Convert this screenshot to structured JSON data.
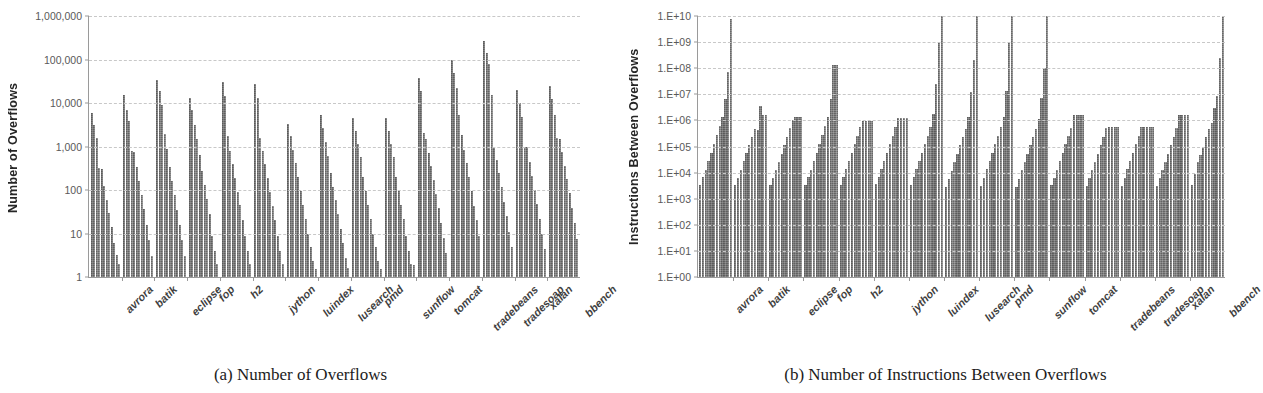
{
  "figure": {
    "panels": [
      {
        "id": "panel-a",
        "caption": "(a) Number of Overflows",
        "chart_key": 0
      },
      {
        "id": "panel-b",
        "caption": "(b) Number of Instructions Between Overflows",
        "chart_key": 1
      }
    ]
  },
  "chart_data": [
    {
      "type": "bar",
      "title": "",
      "subtitle": "",
      "caption": "(a) Number of Overflows",
      "xlabel": "",
      "ylabel": "Number of Overflows",
      "yscale": "log",
      "ylim": [
        1,
        1000000
      ],
      "yticks": [
        1,
        10,
        100,
        1000,
        10000,
        100000,
        1000000
      ],
      "ytick_labels": [
        "1",
        "10",
        "100",
        "1,000",
        "10,000",
        "100,000",
        "1,000,000"
      ],
      "grid": true,
      "legend": "none",
      "bar_color": "#707070",
      "categories": [
        "avrora",
        "batik",
        "eclipse",
        "fop",
        "h2",
        "jython",
        "luindex",
        "lusearch",
        "pmd",
        "sunflow",
        "tomcat",
        "tradebeans",
        "tradesoap",
        "xalan",
        "bbench"
      ],
      "series": [
        {
          "name": "bar1",
          "values": [
            6000,
            15000,
            34000,
            13000,
            30000,
            27000,
            3300,
            5400,
            4600,
            4600,
            38000,
            96000,
            270000,
            20000,
            25000
          ]
        },
        {
          "name": "bar2",
          "values": [
            3200,
            6800,
            19000,
            7000,
            14500,
            13000,
            1700,
            2700,
            2300,
            2300,
            18500,
            48000,
            140000,
            10000,
            12500
          ]
        },
        {
          "name": "bar3",
          "values": [
            1600,
            3800,
            8800,
            3100,
            1750,
            1600,
            850,
            1300,
            1150,
            1150,
            2000,
            22000,
            80000,
            4800,
            5200
          ]
        },
        {
          "name": "bar4",
          "values": [
            320,
            800,
            1900,
            1500,
            800,
            800,
            420,
            620,
            560,
            560,
            1500,
            5400,
            15000,
            1000,
            1600
          ]
        },
        {
          "name": "bar5",
          "values": [
            310,
            760,
            900,
            650,
            390,
            400,
            200,
            250,
            200,
            200,
            720,
            1800,
            1000,
            950,
            1500
          ]
        },
        {
          "name": "bar6",
          "values": [
            125,
            330,
            330,
            270,
            190,
            190,
            95,
            120,
            95,
            95,
            350,
            850,
            500,
            430,
            750
          ]
        },
        {
          "name": "bar7",
          "values": [
            60,
            160,
            160,
            130,
            92,
            90,
            46,
            58,
            46,
            46,
            170,
            410,
            240,
            205,
            360
          ]
        },
        {
          "name": "bar8",
          "values": [
            30,
            78,
            75,
            62,
            45,
            44,
            22,
            28,
            22,
            22,
            82,
            200,
            115,
            100,
            175
          ]
        },
        {
          "name": "bar9",
          "values": [
            14,
            36,
            34,
            28,
            20,
            20,
            10,
            13,
            10,
            9,
            38,
            95,
            54,
            48,
            84
          ]
        },
        {
          "name": "bar10",
          "values": [
            6,
            16,
            16,
            9,
            9,
            9,
            5,
            6,
            5,
            4,
            17,
            44,
            25,
            22,
            38
          ]
        },
        {
          "name": "bar11",
          "values": [
            3.2,
            7,
            7,
            4,
            4,
            4,
            2.3,
            2.8,
            2.3,
            2,
            8,
            20,
            11,
            10,
            17
          ]
        },
        {
          "name": "bar12",
          "values": [
            2,
            3,
            3,
            2,
            2,
            2,
            1.5,
            1.6,
            1.5,
            1.9,
            3.5,
            9,
            5,
            4.5,
            7.5
          ]
        }
      ]
    },
    {
      "type": "bar",
      "title": "",
      "subtitle": "",
      "caption": "(b) Number of Instructions Between Overflows",
      "xlabel": "",
      "ylabel": "Instructions Between Overflows",
      "yscale": "log",
      "ylim": [
        1,
        10000000000
      ],
      "yticks": [
        1,
        10,
        100,
        1000,
        10000,
        100000,
        1000000,
        10000000,
        100000000,
        1000000000,
        10000000000
      ],
      "ytick_labels": [
        "1.E+00",
        "1.E+01",
        "1.E+02",
        "1.E+03",
        "1.E+04",
        "1.E+05",
        "1.E+06",
        "1.E+07",
        "1.E+08",
        "1.E+09",
        "1.E+10"
      ],
      "grid": true,
      "legend": "none",
      "bar_color": "#707070",
      "categories": [
        "avrora",
        "batik",
        "eclipse",
        "fop",
        "h2",
        "jython",
        "luindex",
        "lusearch",
        "pmd",
        "sunflow",
        "tomcat",
        "tradebeans",
        "tradesoap",
        "xalan",
        "bbench"
      ],
      "series": [
        {
          "name": "bar1",
          "values": [
            3500,
            3400,
            3400,
            3400,
            3500,
            3600,
            3500,
            2900,
            3200,
            2900,
            3300,
            3200,
            3200,
            3200,
            3400
          ]
        },
        {
          "name": "bar2",
          "values": [
            6500,
            6200,
            6000,
            6500,
            6500,
            6600,
            6500,
            5600,
            6300,
            5800,
            6100,
            6000,
            6100,
            6000,
            8500
          ]
        },
        {
          "name": "bar3",
          "values": [
            13000,
            13000,
            12500,
            13000,
            13500,
            13500,
            13500,
            12000,
            13500,
            12500,
            13000,
            12500,
            13500,
            12500,
            25000
          ]
        },
        {
          "name": "bar4",
          "values": [
            28000,
            27000,
            26000,
            28000,
            28000,
            28000,
            28000,
            25000,
            28000,
            26000,
            27000,
            26000,
            28000,
            26000,
            48000
          ]
        },
        {
          "name": "bar5",
          "values": [
            58000,
            55000,
            54000,
            58000,
            58000,
            58000,
            58000,
            52000,
            58000,
            54000,
            56000,
            54000,
            58000,
            54000,
            100000
          ]
        },
        {
          "name": "bar6",
          "values": [
            130000,
            110000,
            110000,
            130000,
            125000,
            125000,
            125000,
            110000,
            125000,
            110000,
            120000,
            115000,
            125000,
            115000,
            230000
          ]
        },
        {
          "name": "bar7",
          "values": [
            270000,
            230000,
            230000,
            270000,
            260000,
            260000,
            260000,
            230000,
            260000,
            230000,
            250000,
            240000,
            260000,
            240000,
            480000
          ]
        },
        {
          "name": "bar8",
          "values": [
            620000,
            480000,
            500000,
            600000,
            550000,
            560000,
            560000,
            480000,
            560000,
            480000,
            520000,
            500000,
            560000,
            500000,
            820000
          ]
        },
        {
          "name": "bar9",
          "values": [
            1300000,
            420000,
            1050000,
            1300000,
            950000,
            1200000,
            1800000,
            1300000,
            1300000,
            1100000,
            1550000,
            560000,
            560000,
            1600000,
            3000000
          ]
        },
        {
          "name": "bar10",
          "values": [
            6500000,
            3500000,
            1400000,
            6500000,
            950000,
            1200000,
            25000000,
            12000000,
            13000000,
            7000000,
            1600000,
            560000,
            560000,
            1600000,
            9000000
          ]
        },
        {
          "name": "bar11",
          "values": [
            70000000,
            1600000,
            1400000,
            130000000,
            950000,
            1200000,
            1000000000,
            200000000,
            1000000000,
            100000000,
            1600000,
            560000,
            560000,
            1600000,
            250000000
          ]
        },
        {
          "name": "bar12",
          "values": [
            7500000000,
            1600000,
            1400000,
            130000000,
            950000,
            1200000,
            10000000000,
            10000000000,
            10000000000,
            10000000000,
            1600000,
            560000,
            560000,
            1600000,
            10000000000
          ]
        }
      ]
    }
  ]
}
